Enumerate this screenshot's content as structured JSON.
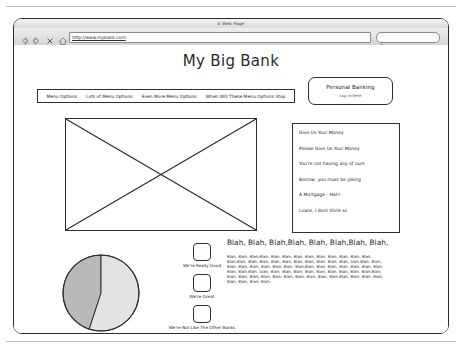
{
  "window": {
    "title": "A Web Page",
    "toolbar": {
      "back_icon": "back-arrow-icon",
      "forward_icon": "forward-arrow-icon",
      "stop_icon": "stop-x-icon",
      "home_icon": "home-icon",
      "url_value": "http://www.mybank.com",
      "url_placeholder": "http://",
      "search_icon": "search-magnifier-icon",
      "search_value": "",
      "search_placeholder": ""
    }
  },
  "page": {
    "site_title": "My Big Bank",
    "login": {
      "title": "Personal Banking",
      "subtitle": "Log in here"
    },
    "menu": [
      {
        "label": "Menu Options"
      },
      {
        "label": "Lots of Menu Options"
      },
      {
        "label": "Even More Menu Options"
      },
      {
        "label": "When Will These Menu Options Stop"
      }
    ],
    "hero": {
      "alt": "image-placeholder"
    },
    "promo_list": [
      {
        "label": "Give Us Your Money"
      },
      {
        "label": "Please Give Us Your Money"
      },
      {
        "label": "You're not having any of ours"
      },
      {
        "label": "Borrow, you must be joking"
      },
      {
        "label": "A Mortgage - Hah!"
      },
      {
        "label": "Loans, I dont think so"
      }
    ],
    "checkboxes": [
      {
        "label": "We're Really Good",
        "checked": false
      },
      {
        "label": "We're Great",
        "checked": false
      },
      {
        "label": "We're Not Like The Other Banks",
        "checked": false
      }
    ],
    "article": {
      "heading": "Blah, Blah, Blah,Blah, Blah, Blah,Blah, Blah,",
      "body": "Blah, Blah, Blah,Blah, Blah, Blah, Blah, Blah, Blah, Blah, Blah, Blah, Blah, Blah,Blah, Blah, Blah, Blah, Blah, Blah, Blah, Blah, Blah, Blah, blah,Blah, Blah, Blah, Blah, Blah, Blah, Blah, Blah, Blah,Blah, Blah, Blah, Blah, Blah, Blah, Blah, Blah, Blah,Blah, blah, Blah, Blah, Blah, Blah, Blah, Blah, Blah, Blah, Blah,Blah, Blah, Blah, Blah, Blah, Blah, Blah, Blah, Blah, Blah, Blah,Blah, Blah, Blah, Blah, Blah, Blah, Blah, Blah."
    }
  },
  "chart_data": {
    "type": "pie",
    "title": "",
    "labels": [
      "Slice A",
      "Slice B"
    ],
    "values": [
      55,
      45
    ],
    "colors": [
      "#e3e3e3",
      "#b9b9b9"
    ],
    "legend": "none"
  }
}
